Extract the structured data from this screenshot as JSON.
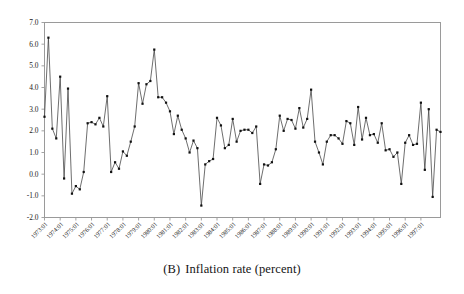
{
  "caption": {
    "label": "(B)",
    "text": "Inflation rate (percent)",
    "full": "(B)  Inflation rate (percent)"
  },
  "chart_data": {
    "type": "line",
    "title": "",
    "subtitle": "",
    "xlabel": "",
    "ylabel": "",
    "legend": [],
    "legend_position": "none",
    "grid": false,
    "marker": "square",
    "marker_size": 2.2,
    "line_color": "#3d3d3d",
    "marker_color": "#111111",
    "frame_color": "#9a9a9a",
    "ylim": [
      -2.0,
      7.0
    ],
    "yticks": [
      7.0,
      6.0,
      5.0,
      4.0,
      3.0,
      2.0,
      1.0,
      0.0,
      -1.0,
      -2.0
    ],
    "ytick_labels": [
      "7.0",
      "6.0",
      "5.0",
      "4.0",
      "3.0",
      "2.0",
      "1.0",
      "0.0",
      "-1.0",
      "-2.0"
    ],
    "xtick_labels": [
      "1973:01",
      "1974:01",
      "1975:01",
      "1976:01",
      "1977:01",
      "1978:01",
      "1979:01",
      "1980:01",
      "1981:01",
      "1982:01",
      "1983:01",
      "1984:01",
      "1985:01",
      "1986:01",
      "1987:01",
      "1988:01",
      "1989:01",
      "1990:01",
      "1991:01",
      "1992:01",
      "1993:01",
      "1994:01",
      "1995:01",
      "1996:01",
      "1997:01"
    ],
    "xtick_label_rotation": -45,
    "x_start": "1973:01",
    "x_frequency": "quarterly",
    "x": [
      "1973:01",
      "1973:02",
      "1973:03",
      "1973:04",
      "1974:01",
      "1974:02",
      "1974:03",
      "1974:04",
      "1975:01",
      "1975:02",
      "1975:03",
      "1975:04",
      "1976:01",
      "1976:02",
      "1976:03",
      "1976:04",
      "1977:01",
      "1977:02",
      "1977:03",
      "1977:04",
      "1978:01",
      "1978:02",
      "1978:03",
      "1978:04",
      "1979:01",
      "1979:02",
      "1979:03",
      "1979:04",
      "1980:01",
      "1980:02",
      "1980:03",
      "1980:04",
      "1981:01",
      "1981:02",
      "1981:03",
      "1981:04",
      "1982:01",
      "1982:02",
      "1982:03",
      "1982:04",
      "1983:01",
      "1983:02",
      "1983:03",
      "1983:04",
      "1984:01",
      "1984:02",
      "1984:03",
      "1984:04",
      "1985:01",
      "1985:02",
      "1985:03",
      "1985:04",
      "1986:01",
      "1986:02",
      "1986:03",
      "1986:04",
      "1987:01",
      "1987:02",
      "1987:03",
      "1987:04",
      "1988:01",
      "1988:02",
      "1988:03",
      "1988:04",
      "1989:01",
      "1989:02",
      "1989:03",
      "1989:04",
      "1990:01",
      "1990:02",
      "1990:03",
      "1990:04",
      "1991:01",
      "1991:02",
      "1991:03",
      "1991:04",
      "1992:01",
      "1992:02",
      "1992:03",
      "1992:04",
      "1993:01",
      "1993:02",
      "1993:03",
      "1993:04",
      "1994:01",
      "1994:02",
      "1994:03",
      "1994:04",
      "1995:01",
      "1995:02",
      "1995:03",
      "1995:04",
      "1996:01",
      "1996:02",
      "1996:03",
      "1996:04",
      "1997:01",
      "1997:02",
      "1997:03",
      "1997:04",
      "1998:01",
      "1998:02"
    ],
    "values": [
      2.65,
      6.3,
      2.1,
      1.65,
      4.5,
      -0.2,
      3.95,
      -0.9,
      -0.55,
      -0.7,
      0.1,
      2.35,
      2.4,
      2.3,
      2.6,
      2.2,
      3.6,
      0.1,
      0.55,
      0.25,
      1.05,
      0.85,
      1.5,
      2.2,
      4.2,
      3.25,
      4.15,
      4.3,
      5.75,
      3.55,
      3.55,
      3.3,
      2.9,
      1.85,
      2.7,
      2.05,
      1.65,
      1.0,
      1.55,
      1.2,
      -1.45,
      0.45,
      0.6,
      0.7,
      2.6,
      2.25,
      1.2,
      1.35,
      2.55,
      1.5,
      2.0,
      2.05,
      2.05,
      1.9,
      2.2,
      -0.45,
      0.45,
      0.4,
      0.55,
      1.15,
      2.7,
      2.0,
      2.55,
      2.5,
      2.1,
      3.05,
      2.15,
      2.55,
      3.9,
      1.5,
      1.0,
      0.45,
      1.5,
      1.8,
      1.8,
      1.65,
      1.4,
      2.45,
      2.35,
      1.35,
      3.1,
      1.6,
      2.6,
      1.8,
      1.85,
      1.45,
      2.35,
      1.1,
      1.15,
      0.8,
      1.0,
      -0.45,
      1.45,
      1.8,
      1.35,
      1.4,
      3.3,
      0.2,
      3.0,
      -1.05,
      2.05,
      1.95
    ]
  }
}
